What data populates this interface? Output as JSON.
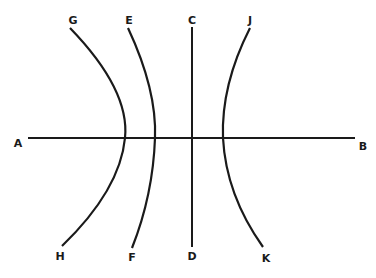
{
  "diagram": {
    "title": "",
    "stroke_color": "#1a1a1a",
    "labels": {
      "A": "A",
      "B": "B",
      "C": "C",
      "D": "D",
      "E": "E",
      "F": "F",
      "G": "G",
      "H": "H",
      "J": "J",
      "K": "K"
    },
    "lines": [
      {
        "id": "AB",
        "type": "straight-horizontal",
        "from": "A",
        "to": "B"
      },
      {
        "id": "CD",
        "type": "straight-vertical",
        "from": "C",
        "to": "D"
      },
      {
        "id": "EF",
        "type": "curve-bulging-right-slight",
        "from": "E",
        "to": "F"
      },
      {
        "id": "GH",
        "type": "curve-bulging-right-strong",
        "from": "G",
        "to": "H"
      },
      {
        "id": "JK",
        "type": "curve-bulging-left",
        "from": "J",
        "to": "K"
      }
    ]
  }
}
